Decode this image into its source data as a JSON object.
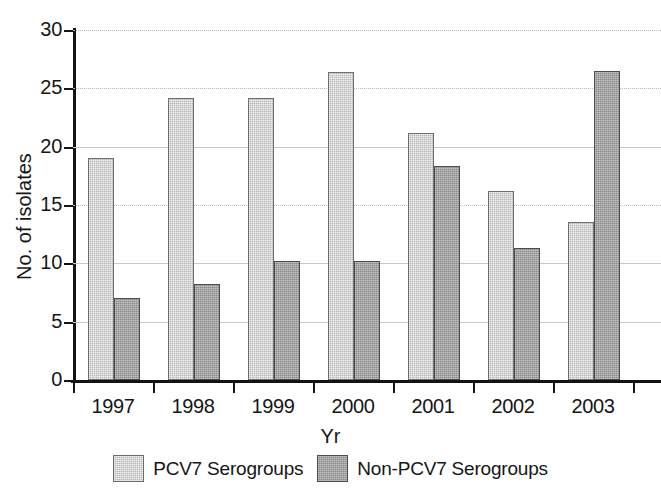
{
  "chart_data": {
    "type": "bar",
    "title": "",
    "xlabel": "Yr",
    "ylabel": "No. of isolates",
    "categories": [
      "1997",
      "1998",
      "1999",
      "2000",
      "2001",
      "2002",
      "2003"
    ],
    "series": [
      {
        "name": "PCV7 Serogroups",
        "color": "#b6b6b6",
        "values": [
          19.0,
          24.2,
          24.2,
          26.4,
          21.2,
          16.2,
          13.5
        ]
      },
      {
        "name": "Non-PCV7 Serogroups",
        "color": "#8b8b8b",
        "values": [
          7.0,
          8.2,
          10.2,
          10.2,
          18.3,
          11.3,
          26.5
        ]
      }
    ],
    "ylim": [
      0,
      30
    ],
    "yticks": [
      0,
      5,
      10,
      15,
      20,
      25,
      30
    ],
    "ytick_labels": [
      "0",
      "5",
      "10",
      "15",
      "20",
      "25",
      "30"
    ],
    "grid": true,
    "grid_axis": "y",
    "legend_position": "bottom-center"
  },
  "legend": {
    "items": [
      {
        "label": "PCV7 Serogroups",
        "swatch": "light"
      },
      {
        "label": "Non-PCV7 Serogroups",
        "swatch": "dark"
      }
    ]
  },
  "axes": {
    "x_title": "Yr",
    "y_title": "No. of isolates"
  }
}
